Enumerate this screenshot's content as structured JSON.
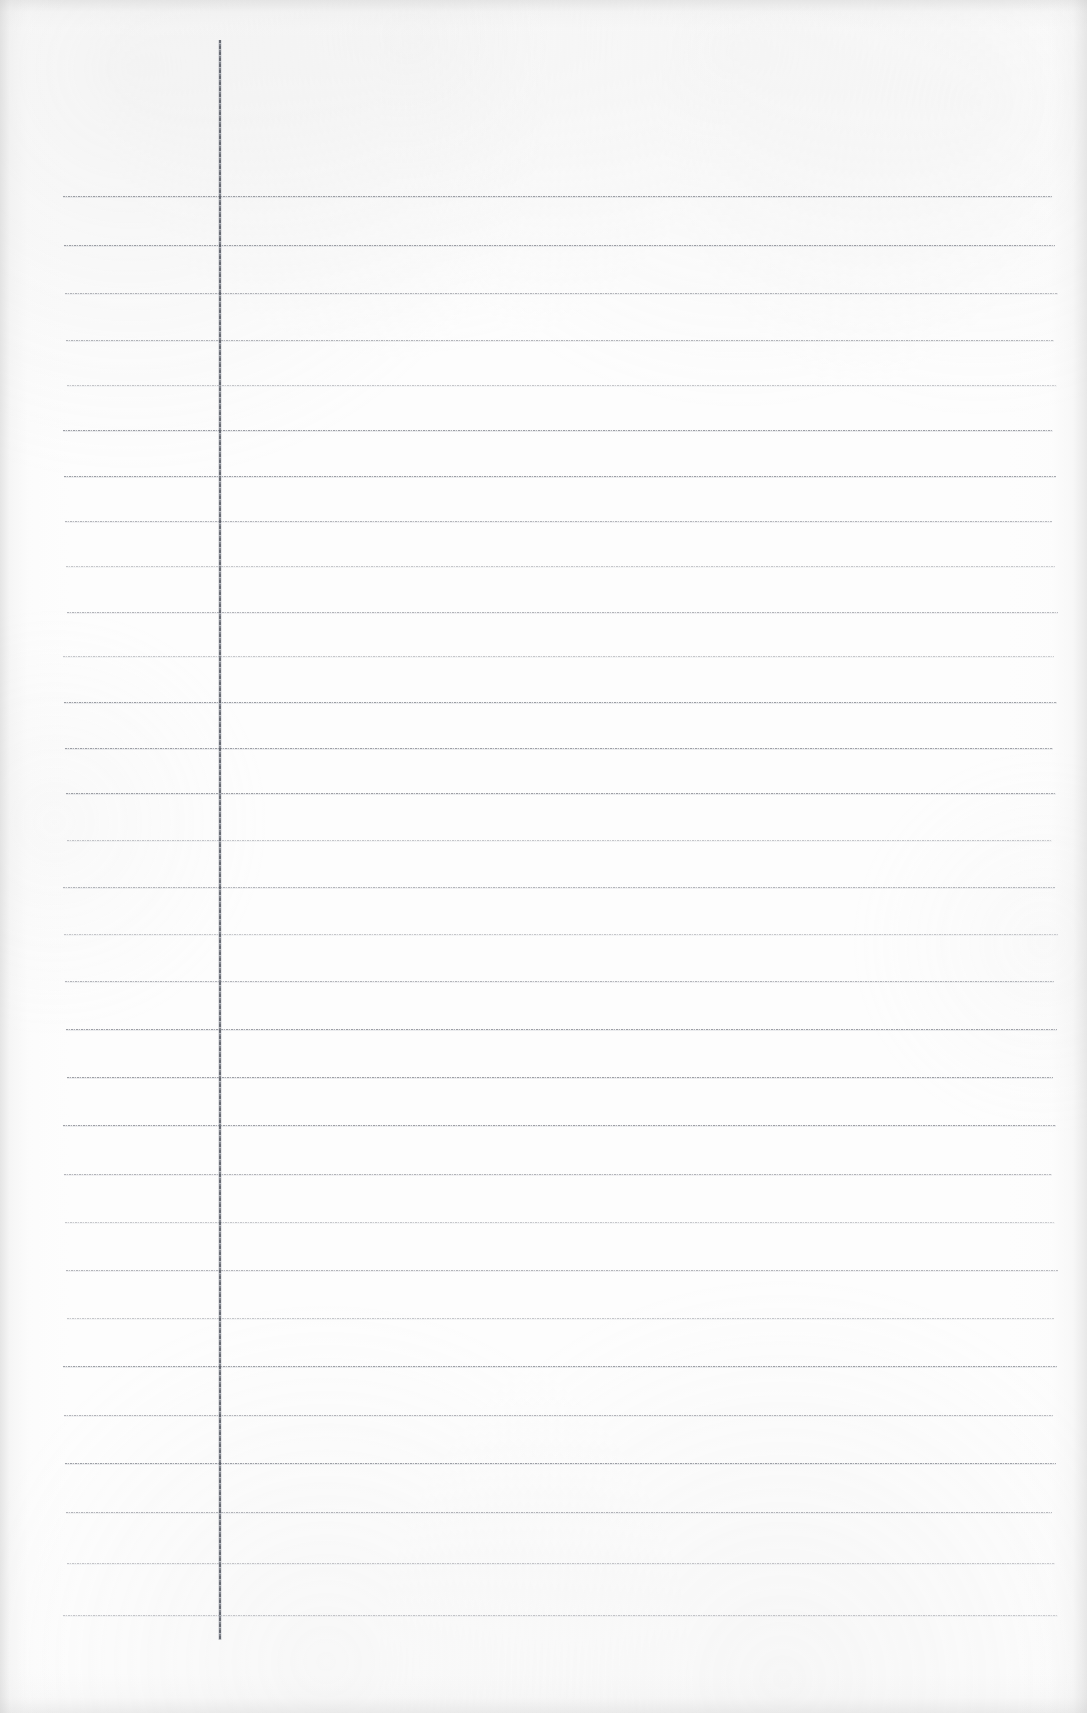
{
  "document": {
    "kind": "scanned-lined-paper",
    "title": "",
    "page_width": 1087,
    "page_height": 1713,
    "background_color": "#fdfdfd",
    "content_text": "",
    "is_blank": true
  },
  "ruling": {
    "line_color": "#60646e",
    "line_count": 28,
    "first_line_y": 196,
    "line_spacing": 50.5,
    "line_start_x": 65,
    "line_end_x": 1055,
    "lines_y": [
      196,
      245,
      293,
      340,
      385,
      430,
      476,
      521,
      566,
      612,
      656,
      702,
      748,
      793,
      840,
      887,
      934,
      981,
      1029,
      1077,
      1125,
      1174,
      1222,
      1270,
      1318,
      1366,
      1415,
      1463
    ],
    "line_weights": [
      "dark",
      "dark",
      "mid",
      "mid",
      "light",
      "dark",
      "dark",
      "mid",
      "light",
      "mid",
      "light",
      "dark",
      "dark",
      "dark",
      "light",
      "mid",
      "light",
      "mid",
      "dark",
      "dark",
      "dark",
      "mid",
      "light",
      "mid",
      "light",
      "dark",
      "mid",
      "dark"
    ]
  },
  "extra_lines": {
    "lines_y": [
      1512,
      1563,
      1615
    ],
    "line_weights": [
      "mid",
      "light",
      "light"
    ]
  },
  "margin_rule": {
    "name": "vertical-margin-rule",
    "color": "#4e525c",
    "x": 219,
    "y_start": 40,
    "y_end": 1640,
    "width": 2
  },
  "scan": {
    "edge_shadow_color": "#cbcbcb",
    "paper_tone": "#fdfdfd",
    "has_grain": true
  }
}
